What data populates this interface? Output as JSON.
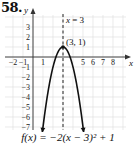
{
  "problem": {
    "number": "58."
  },
  "chart_data": {
    "type": "line",
    "title": "",
    "function": "f(x) = -2(x - 3)^2 + 1",
    "equation_label": "f(x) = −2(x − 3)² + 1",
    "xlabel": "x",
    "ylabel": "y",
    "xlim": [
      -2.8,
      9.2
    ],
    "ylim": [
      -7.3,
      4.2
    ],
    "x_tick_labels": [
      "-2",
      "-1",
      "1",
      "5",
      "6",
      "7",
      "8"
    ],
    "x_tick_values": [
      -2,
      -1,
      1,
      5,
      6,
      7,
      8
    ],
    "y_tick_labels": [
      "3",
      "2",
      "1",
      "-1",
      "-2",
      "-3",
      "-4",
      "-5",
      "-6",
      "-7"
    ],
    "y_tick_values": [
      3,
      2,
      1,
      -1,
      -2,
      -3,
      -4,
      -5,
      -6,
      -7
    ],
    "grid": true,
    "axis_of_symmetry": {
      "x": 3,
      "label": "x = 3",
      "style": "dashed"
    },
    "vertex": {
      "x": 3,
      "y": 1,
      "label": "(3, 1)"
    },
    "series": [
      {
        "name": "f(x)",
        "x": [
          0.95,
          1.5,
          2,
          2.5,
          3,
          3.5,
          4,
          4.5,
          5.05
        ],
        "values": [
          -7.405,
          -3.5,
          -1,
          0.5,
          1,
          0.5,
          -1,
          -3.5,
          -7.405
        ]
      }
    ],
    "arrows_on_ends": true
  }
}
